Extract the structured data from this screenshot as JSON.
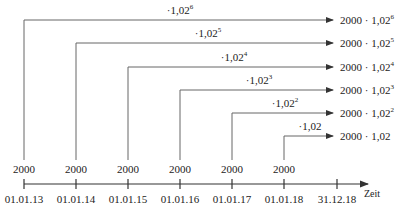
{
  "diagram": {
    "axis_label": "Zeit",
    "deposit_value": "2000",
    "dates": [
      "01.01.13",
      "01.01.14",
      "01.01.15",
      "01.01.16",
      "01.01.17",
      "01.01.18",
      "31.12.18"
    ],
    "rows": [
      {
        "factor_base": "·1,02",
        "exp": "6",
        "result_base": "2000 · 1,02",
        "result_exp": "6"
      },
      {
        "factor_base": "·1,02",
        "exp": "5",
        "result_base": "2000 · 1,02",
        "result_exp": "5"
      },
      {
        "factor_base": "·1,02",
        "exp": "4",
        "result_base": "2000 · 1,02",
        "result_exp": "4"
      },
      {
        "factor_base": "·1,02",
        "exp": "3",
        "result_base": "2000 · 1,02",
        "result_exp": "3"
      },
      {
        "factor_base": "·1,02",
        "exp": "2",
        "result_base": "2000 · 1,02",
        "result_exp": "2"
      },
      {
        "factor_base": "·1,02",
        "exp": "",
        "result_base": "2000 · 1,02",
        "result_exp": ""
      }
    ],
    "line_color": "#555555"
  }
}
